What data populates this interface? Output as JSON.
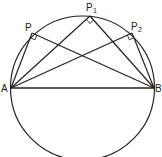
{
  "diagram": {
    "stroke_color": "#222222",
    "points": {
      "A": {
        "label": "A",
        "x": 11,
        "y": 88
      },
      "B": {
        "label": "B",
        "x": 154,
        "y": 88
      },
      "P": {
        "label": "P",
        "sub": "",
        "x": 32,
        "y": 33
      },
      "P1": {
        "label": "P",
        "sub": "1",
        "x": 90,
        "y": 16
      },
      "P2": {
        "label": "P",
        "sub": "2",
        "x": 132,
        "y": 33
      }
    },
    "circle": {
      "cx": 82.5,
      "cy": 88,
      "r": 72
    },
    "right_angle_marks": [
      "P",
      "P1",
      "P2"
    ]
  }
}
